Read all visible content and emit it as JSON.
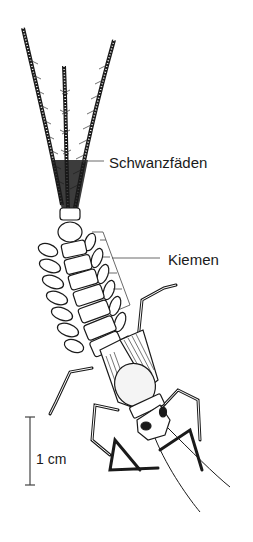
{
  "figure": {
    "labels": {
      "tail_filaments": "Schwanzfäden",
      "gills": "Kiemen",
      "scale": "1 cm"
    },
    "colors": {
      "ink": "#1a1a1a",
      "background": "#ffffff",
      "leader": "#444444"
    }
  }
}
